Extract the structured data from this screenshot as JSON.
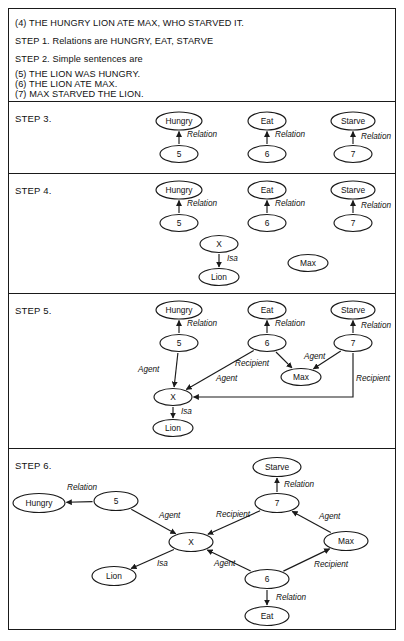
{
  "document": {
    "intro_lines": [
      {
        "text": "(4)  THE HUNGRY LION ATE MAX, WHO STARVED IT.",
        "x": 14,
        "y": 17
      },
      {
        "text": "STEP 1.  Relations are HUNGRY, EAT, STARVE",
        "x": 14,
        "y": 35
      },
      {
        "text": "STEP 2.  Simple sentences are",
        "x": 14,
        "y": 53
      },
      {
        "text": "(5)  THE LION WAS HUNGRY.",
        "x": 14,
        "y": 68
      },
      {
        "text": "(6)  THE LION ATE MAX.",
        "x": 14,
        "y": 78
      },
      {
        "text": "(7)  MAX STARVED THE LION.",
        "x": 14,
        "y": 88
      }
    ],
    "dividers": [
      100,
      172,
      292,
      447
    ],
    "panels": [
      {
        "id": "step3",
        "label": "STEP 3.",
        "label_x": 14,
        "label_y": 112,
        "top": 100,
        "height": 72
      },
      {
        "id": "step4",
        "label": "STEP 4.",
        "label_x": 14,
        "label_y": 184,
        "top": 172,
        "height": 120
      },
      {
        "id": "step5",
        "label": "STEP 5.",
        "label_x": 14,
        "label_y": 304,
        "top": 292,
        "height": 155
      },
      {
        "id": "step6",
        "label": "STEP 6.",
        "label_x": 14,
        "label_y": 459,
        "top": 447,
        "height": 183
      }
    ]
  },
  "chart_data": {
    "type": "diagram",
    "notation": {
      "node_shape": "ellipse",
      "edge_style": "directed arrow",
      "edge_label_style": "italic",
      "relation_labels": [
        "Relation",
        "Isa",
        "Agent",
        "Recipient"
      ]
    },
    "graphs": [
      {
        "step": "STEP 3",
        "nodes": [
          {
            "id": "hungry",
            "label": "Hungry",
            "cx": 178,
            "cy": 120,
            "rx": 23,
            "ry": 9
          },
          {
            "id": "eat",
            "label": "Eat",
            "cx": 266,
            "cy": 120,
            "rx": 19,
            "ry": 9
          },
          {
            "id": "starve",
            "label": "Starve",
            "cx": 352,
            "cy": 120,
            "rx": 22,
            "ry": 9
          },
          {
            "id": "n5",
            "label": "5",
            "cx": 178,
            "cy": 153,
            "rx": 19,
            "ry": 8.5
          },
          {
            "id": "n6",
            "label": "6",
            "cx": 266,
            "cy": 153,
            "rx": 19,
            "ry": 8.5
          },
          {
            "id": "n7",
            "label": "7",
            "cx": 352,
            "cy": 153,
            "rx": 19,
            "ry": 8.5
          }
        ],
        "edges": [
          {
            "from": "n5",
            "to": "hungry",
            "label": "Relation",
            "lx": 186,
            "ly": 134
          },
          {
            "from": "n6",
            "to": "eat",
            "label": "Relation",
            "lx": 274,
            "ly": 134
          },
          {
            "from": "n7",
            "to": "starve",
            "label": "Relation",
            "lx": 360,
            "ly": 136
          }
        ]
      },
      {
        "step": "STEP 4",
        "nodes": [
          {
            "id": "hungry",
            "label": "Hungry",
            "cx": 178,
            "cy": 189,
            "rx": 23,
            "ry": 9
          },
          {
            "id": "eat",
            "label": "Eat",
            "cx": 266,
            "cy": 189,
            "rx": 19,
            "ry": 9
          },
          {
            "id": "starve",
            "label": "Starve",
            "cx": 352,
            "cy": 189,
            "rx": 22,
            "ry": 9
          },
          {
            "id": "n5",
            "label": "5",
            "cx": 178,
            "cy": 222,
            "rx": 19,
            "ry": 8.5
          },
          {
            "id": "n6",
            "label": "6",
            "cx": 266,
            "cy": 222,
            "rx": 19,
            "ry": 8.5
          },
          {
            "id": "n7",
            "label": "7",
            "cx": 352,
            "cy": 222,
            "rx": 19,
            "ry": 8.5
          },
          {
            "id": "x",
            "label": "X",
            "cx": 218,
            "cy": 243,
            "rx": 19,
            "ry": 8.5
          },
          {
            "id": "lion",
            "label": "Lion",
            "cx": 218,
            "cy": 276,
            "rx": 20,
            "ry": 8.5
          },
          {
            "id": "max",
            "label": "Max",
            "cx": 307,
            "cy": 262,
            "rx": 20,
            "ry": 8.5
          }
        ],
        "edges": [
          {
            "from": "n5",
            "to": "hungry",
            "label": "Relation",
            "lx": 186,
            "ly": 203
          },
          {
            "from": "n6",
            "to": "eat",
            "label": "Relation",
            "lx": 274,
            "ly": 203
          },
          {
            "from": "n7",
            "to": "starve",
            "label": "Relation",
            "lx": 360,
            "ly": 205
          },
          {
            "from": "x",
            "to": "lion",
            "label": "Isa",
            "lx": 226,
            "ly": 258
          }
        ]
      },
      {
        "step": "STEP 5",
        "nodes": [
          {
            "id": "hungry",
            "label": "Hungry",
            "cx": 178,
            "cy": 309,
            "rx": 23,
            "ry": 9
          },
          {
            "id": "eat",
            "label": "Eat",
            "cx": 266,
            "cy": 309,
            "rx": 19,
            "ry": 9
          },
          {
            "id": "starve",
            "label": "Starve",
            "cx": 352,
            "cy": 309,
            "rx": 22,
            "ry": 9
          },
          {
            "id": "n5",
            "label": "5",
            "cx": 178,
            "cy": 342,
            "rx": 19,
            "ry": 8.5
          },
          {
            "id": "n6",
            "label": "6",
            "cx": 266,
            "cy": 342,
            "rx": 19,
            "ry": 8.5
          },
          {
            "id": "n7",
            "label": "7",
            "cx": 352,
            "cy": 342,
            "rx": 19,
            "ry": 8.5
          },
          {
            "id": "x",
            "label": "X",
            "cx": 172,
            "cy": 396,
            "rx": 19,
            "ry": 8.5
          },
          {
            "id": "lion",
            "label": "Lion",
            "cx": 172,
            "cy": 427,
            "rx": 20,
            "ry": 8.5
          },
          {
            "id": "max",
            "label": "Max",
            "cx": 300,
            "cy": 376,
            "rx": 20,
            "ry": 8.5
          }
        ],
        "edges": [
          {
            "from": "n5",
            "to": "hungry",
            "label": "Relation",
            "lx": 186,
            "ly": 323
          },
          {
            "from": "n6",
            "to": "eat",
            "label": "Relation",
            "lx": 274,
            "ly": 323
          },
          {
            "from": "n7",
            "to": "starve",
            "label": "Relation",
            "lx": 360,
            "ly": 325
          },
          {
            "from": "n5",
            "to": "x",
            "label": "Agent",
            "lx": 137,
            "ly": 369
          },
          {
            "from": "n6",
            "to": "x",
            "label": "Agent",
            "lx": 215,
            "ly": 378
          },
          {
            "from": "n6",
            "to": "max",
            "label": "Recipient",
            "lx": 234,
            "ly": 363
          },
          {
            "from": "n7",
            "to": "max",
            "label": "Agent",
            "lx": 303,
            "ly": 356
          },
          {
            "from": "n7",
            "to": "x",
            "label": "Recipient",
            "lx": 355,
            "ly": 378
          },
          {
            "from": "x",
            "to": "lion",
            "label": "Isa",
            "lx": 180,
            "ly": 411
          }
        ]
      },
      {
        "step": "STEP 6",
        "nodes": [
          {
            "id": "starve",
            "label": "Starve",
            "cx": 276,
            "cy": 466,
            "rx": 24,
            "ry": 9.5
          },
          {
            "id": "n7",
            "label": "7",
            "cx": 276,
            "cy": 502,
            "rx": 22,
            "ry": 9.5
          },
          {
            "id": "hungry",
            "label": "Hungry",
            "cx": 38,
            "cy": 502,
            "rx": 26,
            "ry": 9.5
          },
          {
            "id": "n5",
            "label": "5",
            "cx": 115,
            "cy": 500,
            "rx": 22,
            "ry": 9.5
          },
          {
            "id": "max",
            "label": "Max",
            "cx": 345,
            "cy": 540,
            "rx": 22,
            "ry": 9.5
          },
          {
            "id": "x",
            "label": "X",
            "cx": 190,
            "cy": 541,
            "rx": 22,
            "ry": 9.5
          },
          {
            "id": "lion",
            "label": "Lion",
            "cx": 113,
            "cy": 575,
            "rx": 22,
            "ry": 9.5
          },
          {
            "id": "n6",
            "label": "6",
            "cx": 266,
            "cy": 578,
            "rx": 22,
            "ry": 9.5
          },
          {
            "id": "eat",
            "label": "Eat",
            "cx": 266,
            "cy": 615,
            "rx": 22,
            "ry": 9.5
          }
        ],
        "edges": [
          {
            "from": "n5",
            "to": "hungry",
            "label": "Relation",
            "lx": 66,
            "ly": 487
          },
          {
            "from": "n5",
            "to": "x",
            "label": "Agent",
            "lx": 158,
            "ly": 515
          },
          {
            "from": "n7",
            "to": "starve",
            "label": "Relation",
            "lx": 283,
            "ly": 484
          },
          {
            "from": "n7",
            "to": "x",
            "label": "Recipient",
            "lx": 215,
            "ly": 514
          },
          {
            "from": "max",
            "to": "n7",
            "label": "Agent",
            "lx": 318,
            "ly": 516
          },
          {
            "from": "n6",
            "to": "max",
            "label": "Recipient",
            "lx": 313,
            "ly": 564
          },
          {
            "from": "n6",
            "to": "x",
            "label": "Agent",
            "lx": 213,
            "ly": 563
          },
          {
            "from": "n6",
            "to": "eat",
            "label": "Relation",
            "lx": 275,
            "ly": 597
          },
          {
            "from": "x",
            "to": "lion",
            "label": "Isa",
            "lx": 156,
            "ly": 563
          }
        ]
      }
    ]
  }
}
